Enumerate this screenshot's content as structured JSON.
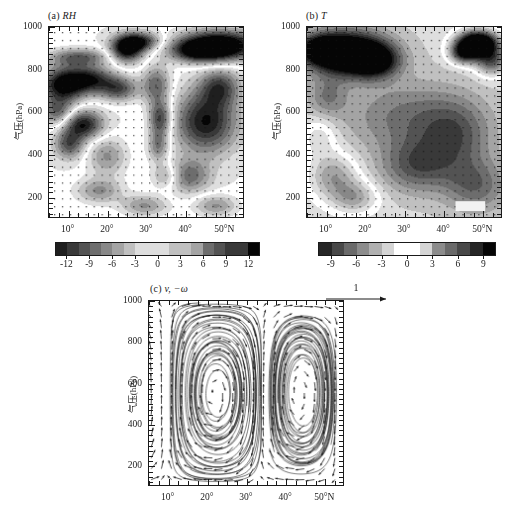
{
  "figure": {
    "background": "#ffffff",
    "foreground": "#1a1a1a"
  },
  "panels": [
    {
      "id": "a",
      "label": "(a)",
      "variable": "RH",
      "title": "(a) RH",
      "xlabel": "",
      "ylabel": "气压(hPa)",
      "xticklabels": [
        "10°",
        "20°",
        "30°",
        "40°",
        "50°N"
      ],
      "yticklabels": [
        "200",
        "400",
        "600",
        "800",
        "1000"
      ]
    },
    {
      "id": "b",
      "label": "(b)",
      "variable": "T",
      "title": "(b) T",
      "xlabel": "",
      "ylabel": "气压(hPa)",
      "xticklabels": [
        "10°",
        "20°",
        "30°",
        "40°",
        "50°N"
      ],
      "yticklabels": [
        "200",
        "400",
        "600",
        "800",
        "1000"
      ]
    },
    {
      "id": "c",
      "label": "(c)",
      "variable": "v, −ω",
      "title": "(c) v, −ω",
      "xlabel": "",
      "ylabel": "气压(hPa)",
      "xticklabels": [
        "10°",
        "20°",
        "30°",
        "40°",
        "50°N"
      ],
      "yticklabels": [
        "200",
        "400",
        "600",
        "800",
        "1000"
      ],
      "quiver_key_label": "1"
    }
  ],
  "colorbars": [
    {
      "for_panel": "a",
      "ticklabels": [
        "-12",
        "-9",
        "-6",
        "-3",
        "0",
        "3",
        "6",
        "9",
        "12"
      ],
      "tickvalues": [
        -12,
        -9,
        -6,
        -3,
        0,
        3,
        6,
        9,
        12
      ],
      "vmin": -13.5,
      "vmax": 13.5,
      "n_cells": 18
    },
    {
      "for_panel": "b",
      "ticklabels": [
        "-9",
        "-6",
        "-3",
        "0",
        "3",
        "6",
        "9"
      ],
      "tickvalues": [
        -9,
        -6,
        -3,
        0,
        3,
        6,
        9
      ],
      "vmin": -10.5,
      "vmax": 10.5,
      "n_cells": 14
    }
  ],
  "chart_data": [
    {
      "type": "heatmap",
      "panel": "a",
      "title": "(a) RH",
      "xlabel": "",
      "ylabel": "气压(hPa)",
      "xlim": [
        5,
        55
      ],
      "ylim": [
        1000,
        100
      ],
      "y_inverted": true,
      "xticks": [
        10,
        20,
        30,
        40,
        50
      ],
      "xticklabels": [
        "10°",
        "20°",
        "30°",
        "40°",
        "50°N"
      ],
      "yticks": [
        200,
        400,
        600,
        800,
        1000
      ],
      "yticklabels": [
        "200",
        "400",
        "600",
        "800",
        "1000"
      ],
      "cmap": "grayscale_diverging",
      "vmin": -13.5,
      "vmax": 13.5,
      "colorbar_ticks": [
        -12,
        -9,
        -6,
        -3,
        0,
        3,
        6,
        9,
        12
      ],
      "grid": false,
      "stipple": true,
      "stipple_desc": "regular grid of small dots marking significance",
      "features": [
        {
          "kind": "max_negative",
          "x": 48,
          "y": 190,
          "value": -12,
          "desc": "strong dark core upper right near 200 hPa"
        },
        {
          "kind": "negative",
          "x": 9,
          "y": 430,
          "value": -8,
          "desc": "dark band mid-left 350-500 hPa"
        },
        {
          "kind": "negative",
          "x": 18,
          "y": 430,
          "value": -7,
          "desc": "dark patch near 20N 400-500 hPa"
        },
        {
          "kind": "negative",
          "x": 30,
          "y": 570,
          "value": -7,
          "desc": "dark core near 30N 550-650 hPa"
        },
        {
          "kind": "positive",
          "x": 18,
          "y": 250,
          "value": 7,
          "desc": "bright column near 18N 200-300 hPa"
        },
        {
          "kind": "positive",
          "x": 14,
          "y": 700,
          "value": 6,
          "desc": "bright lobe low levels 12-20N"
        },
        {
          "kind": "positive",
          "x": 44,
          "y": 600,
          "value": 6,
          "desc": "bright region right half mid-low levels"
        }
      ]
    },
    {
      "type": "heatmap",
      "panel": "b",
      "title": "(b) T",
      "xlabel": "",
      "ylabel": "气压(hPa)",
      "xlim": [
        5,
        55
      ],
      "ylim": [
        1000,
        100
      ],
      "y_inverted": true,
      "xticks": [
        10,
        20,
        30,
        40,
        50
      ],
      "xticklabels": [
        "10°",
        "20°",
        "30°",
        "40°",
        "50°N"
      ],
      "yticks": [
        200,
        400,
        600,
        800,
        1000
      ],
      "yticklabels": [
        "200",
        "400",
        "600",
        "800",
        "1000"
      ],
      "cmap": "grayscale_diverging",
      "vmin": -10.5,
      "vmax": 10.5,
      "colorbar_ticks": [
        -9,
        -6,
        -3,
        0,
        3,
        6,
        9
      ],
      "grid": false,
      "stipple": true,
      "stipple_desc": "regular grid of small dots marking significance",
      "features": [
        {
          "kind": "max_negative",
          "x": 13,
          "y": 220,
          "value": -9,
          "desc": "very dark core upper left 150-300 hPa"
        },
        {
          "kind": "negative",
          "x": 8,
          "y": 200,
          "value": -8,
          "desc": "dark lobe far upper left"
        },
        {
          "kind": "max_positive",
          "x": 48,
          "y": 200,
          "value": 9,
          "desc": "bright white core upper right near 200 hPa"
        },
        {
          "kind": "negative",
          "x": 33,
          "y": 700,
          "value": -5,
          "desc": "broad dark area right-centre low levels"
        },
        {
          "kind": "positive",
          "x": 13,
          "y": 880,
          "value": 3,
          "desc": "lighter band near surface left"
        }
      ]
    },
    {
      "type": "quiver",
      "panel": "c",
      "title": "(c) v, −ω",
      "xlabel": "",
      "ylabel": "气压(hPa)",
      "xlim": [
        5,
        55
      ],
      "ylim": [
        1000,
        100
      ],
      "y_inverted": true,
      "xticks": [
        10,
        20,
        30,
        40,
        50
      ],
      "xticklabels": [
        "10°",
        "20°",
        "30°",
        "40°",
        "50°N"
      ],
      "yticks": [
        200,
        400,
        600,
        800,
        1000
      ],
      "yticklabels": [
        "200",
        "400",
        "600",
        "800",
        "1000"
      ],
      "reference_vector": 1,
      "reference_vector_label": "1",
      "grid": false,
      "features": [
        {
          "kind": "ascending_branch",
          "x": 22,
          "desc": "strong upward motion near 20-25N through whole troposphere"
        },
        {
          "kind": "descending_branch",
          "x": 33,
          "desc": "downward motion near 32-36N"
        },
        {
          "kind": "circulation_cell",
          "center_x": 25,
          "center_y": 800,
          "sense": "closed cell low levels 20-28N"
        },
        {
          "kind": "circulation_cell",
          "center_x": 42,
          "center_y": 820,
          "sense": "secondary cell near 40-45N low levels"
        },
        {
          "kind": "northward_flow",
          "y": 250,
          "desc": "poleward outflow aloft near 200-300 hPa"
        }
      ]
    }
  ]
}
